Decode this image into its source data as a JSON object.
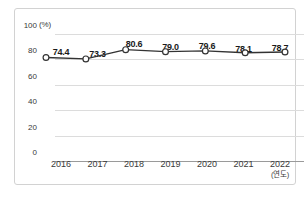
{
  "chart_data": {
    "type": "line",
    "title": "",
    "subtitle": "",
    "xlabel": "(연도)",
    "ylabel": "(%)",
    "categories": [
      "2016",
      "2017",
      "2018",
      "2019",
      "2020",
      "2021",
      "2022"
    ],
    "values": [
      74.4,
      73.3,
      80.6,
      79.0,
      79.6,
      78.1,
      78.7
    ],
    "point_labels": [
      "74.4",
      "73.3",
      "80.6",
      "79.0",
      "79.6",
      "78.1",
      "78.7"
    ],
    "series": [
      {
        "name": "",
        "values": [
          74.4,
          73.3,
          80.6,
          79.0,
          79.6,
          78.1,
          78.7
        ]
      }
    ],
    "ylim": [
      0,
      100
    ],
    "yticks": [
      0,
      20,
      40,
      60,
      80,
      100
    ],
    "ytick_labels": [
      "0",
      "20",
      "40",
      "60",
      "80",
      "100"
    ],
    "grid": true,
    "legend": false,
    "legend_position": "none",
    "marker": "open-circle",
    "colors": {
      "line": "#333333",
      "marker_fill": "#ffffff",
      "marker_stroke": "#333333",
      "grid": "#dcdcdc",
      "axis": "#9a9a9a",
      "text": "#3a3a3a",
      "label_text": "#1a1a1a",
      "frame": "#d2d2d2",
      "background": "#ffffff"
    }
  }
}
